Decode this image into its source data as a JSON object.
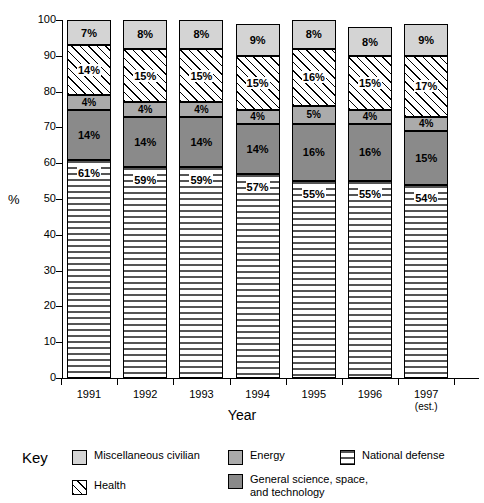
{
  "chart_data": {
    "type": "bar",
    "subtype": "stacked-100-percent",
    "title": "",
    "xlabel": "Year",
    "ylabel": "%",
    "ylim": [
      0,
      100
    ],
    "yticks": [
      0,
      10,
      20,
      30,
      40,
      50,
      60,
      70,
      80,
      90,
      100
    ],
    "grid": false,
    "legend_position": "bottom",
    "categories": [
      "1991",
      "1992",
      "1993",
      "1994",
      "1995",
      "1996",
      "1997"
    ],
    "category_sublabels": [
      "",
      "",
      "",
      "",
      "",
      "",
      "(est.)"
    ],
    "series": [
      {
        "name": "National defense",
        "pattern": "horizontal-lines",
        "color": "#ffffff",
        "values": [
          61,
          59,
          59,
          57,
          55,
          55,
          54
        ],
        "labels": [
          "61%",
          "59%",
          "59%",
          "57%",
          "55%",
          "55%",
          "54%"
        ]
      },
      {
        "name": "General science, space, and technology",
        "pattern": "solid",
        "color": "#8a8a8a",
        "values": [
          14,
          14,
          14,
          14,
          16,
          16,
          15
        ],
        "labels": [
          "14%",
          "14%",
          "14%",
          "14%",
          "16%",
          "16%",
          "15%"
        ]
      },
      {
        "name": "Energy",
        "pattern": "solid",
        "color": "#ababab",
        "values": [
          4,
          4,
          4,
          4,
          5,
          4,
          4
        ],
        "labels": [
          "4%",
          "4%",
          "4%",
          "4%",
          "5%",
          "4%",
          "4%"
        ]
      },
      {
        "name": "Health",
        "pattern": "diagonal-hatch",
        "color": "#ffffff",
        "values": [
          14,
          15,
          15,
          15,
          16,
          15,
          17
        ],
        "labels": [
          "14%",
          "15%",
          "15%",
          "15%",
          "16%",
          "15%",
          "17%"
        ]
      },
      {
        "name": "Miscellaneous civilian",
        "pattern": "solid",
        "color": "#d4d4d4",
        "values": [
          7,
          8,
          8,
          9,
          8,
          8,
          9
        ],
        "labels": [
          "7%",
          "8%",
          "8%",
          "9%",
          "8%",
          "8%",
          "9%"
        ]
      }
    ]
  },
  "axes": {
    "y_title": "%",
    "x_title": "Year",
    "y_tick_labels": [
      "0",
      "10",
      "20",
      "30",
      "40",
      "50",
      "60",
      "70",
      "80",
      "90",
      "100"
    ],
    "x_tick_labels": [
      "1991",
      "1992",
      "1993",
      "1994",
      "1995",
      "1996",
      "1997"
    ],
    "x_tick_sublabels": [
      "",
      "",
      "",
      "",
      "",
      "",
      "(est.)"
    ]
  },
  "legend": {
    "key_label": "Key",
    "items": [
      {
        "label": "Miscellaneous civilian",
        "swatch": "fill-misc"
      },
      {
        "label": "Energy",
        "swatch": "fill-energy"
      },
      {
        "label": "National defense",
        "swatch": "fill-defense"
      },
      {
        "label": "Health",
        "swatch": "fill-health"
      },
      {
        "label": "General science, space,\nand technology",
        "swatch": "fill-gensci"
      }
    ]
  },
  "colors": {
    "misc_civilian": "#d4d4d4",
    "energy": "#ababab",
    "general_science": "#8a8a8a",
    "health": "#ffffff",
    "national_defense": "#ffffff",
    "axis": "#000000",
    "background": "#ffffff"
  }
}
